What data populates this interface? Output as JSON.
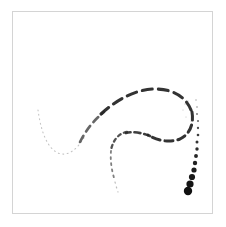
{
  "figure": {
    "title": "",
    "background_color": "#ffffff",
    "border_color": "#d4d4d4",
    "stroke_color": "#1a1a1a",
    "frame": {
      "x": 12,
      "y": 11,
      "width": 201,
      "height": 203
    }
  },
  "chart_data": {
    "type": "line",
    "title": "",
    "xlabel": "",
    "ylabel": "",
    "xlim": [
      0,
      226
    ],
    "ylim": [
      0,
      227
    ],
    "grid": false,
    "legend": null,
    "series": [
      {
        "name": "stroke-trail",
        "style": "dashed-to-dotted",
        "x": [
          38,
          41,
          44,
          47,
          51,
          56,
          61,
          66,
          71,
          76,
          80,
          84,
          90,
          97,
          105,
          114,
          123,
          132,
          141,
          150,
          158,
          165,
          172,
          178,
          183,
          187,
          190,
          192,
          193,
          193,
          192,
          190,
          187,
          183,
          178,
          172,
          165,
          157,
          149,
          141,
          134,
          128,
          123,
          119,
          116,
          114,
          112,
          111,
          110,
          110,
          111,
          113,
          116,
          119,
          121,
          122,
          122,
          121,
          119,
          117,
          115,
          113,
          184,
          186,
          188,
          190,
          192,
          194,
          196,
          197,
          198,
          198,
          197,
          196,
          195,
          193,
          191,
          189
        ],
        "y": [
          110,
          118,
          126,
          134,
          141,
          147,
          152,
          154,
          154,
          152,
          148,
          142,
          134,
          126,
          118,
          110,
          103,
          97,
          93,
          90,
          89,
          90,
          93,
          97,
          102,
          108,
          114,
          120,
          126,
          131,
          135,
          138,
          140,
          141,
          141,
          140,
          139,
          137,
          135,
          133,
          132,
          132,
          133,
          136,
          140,
          145,
          150,
          155,
          160,
          165,
          169,
          172,
          175,
          177,
          179,
          181,
          183,
          185,
          187,
          189,
          190,
          191,
          105,
          112,
          119,
          126,
          133,
          140,
          147,
          154,
          161,
          168,
          174,
          179,
          183,
          187,
          190,
          192
        ]
      }
    ],
    "marker_sizes": {
      "min": 0.6,
      "max": 4.2,
      "note": "marker radius grows monotonically toward the terminal point at the lower right"
    },
    "annotations": []
  }
}
